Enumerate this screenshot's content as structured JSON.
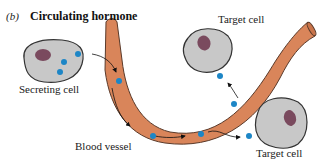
{
  "figure": {
    "panel_label": "(b)",
    "title": "Circulating hormone"
  },
  "labels": {
    "secreting_cell": "Secreting cell",
    "target_cell_top": "Target cell",
    "target_cell_bottom": "Target cell",
    "blood_vessel": "Blood vessel"
  },
  "colors": {
    "vessel_fill": "#d9855a",
    "vessel_stroke": "#5a3a2a",
    "cell_fill": "#c8c8c8",
    "cell_stroke": "#333333",
    "nucleus": "#7a4a5e",
    "hormone": "#1d86c6",
    "arrow": "#111111"
  }
}
